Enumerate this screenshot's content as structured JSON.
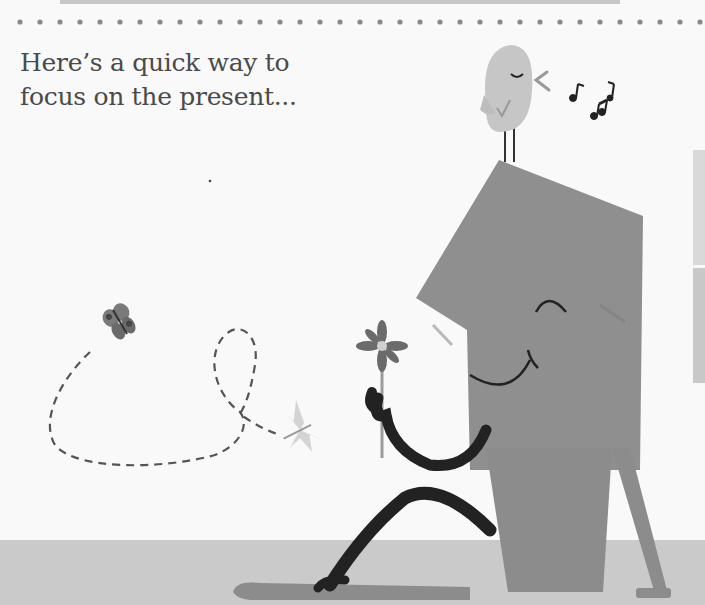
{
  "caption": {
    "line1": "Here’s a quick way to",
    "line2": "focus on the present..."
  },
  "illustration": {
    "elements": [
      "dotted-divider",
      "bird",
      "music-notes",
      "rectangle-character",
      "flower",
      "butterfly-dark",
      "butterfly-light",
      "dashed-flight-path",
      "ground",
      "side-panel"
    ]
  },
  "colors": {
    "background": "#f9f9f9",
    "character": "#8c8c8c",
    "ground": "#c9c9c9",
    "bird": "#c4c4c4",
    "ink": "#222222",
    "dots": "#888888"
  }
}
